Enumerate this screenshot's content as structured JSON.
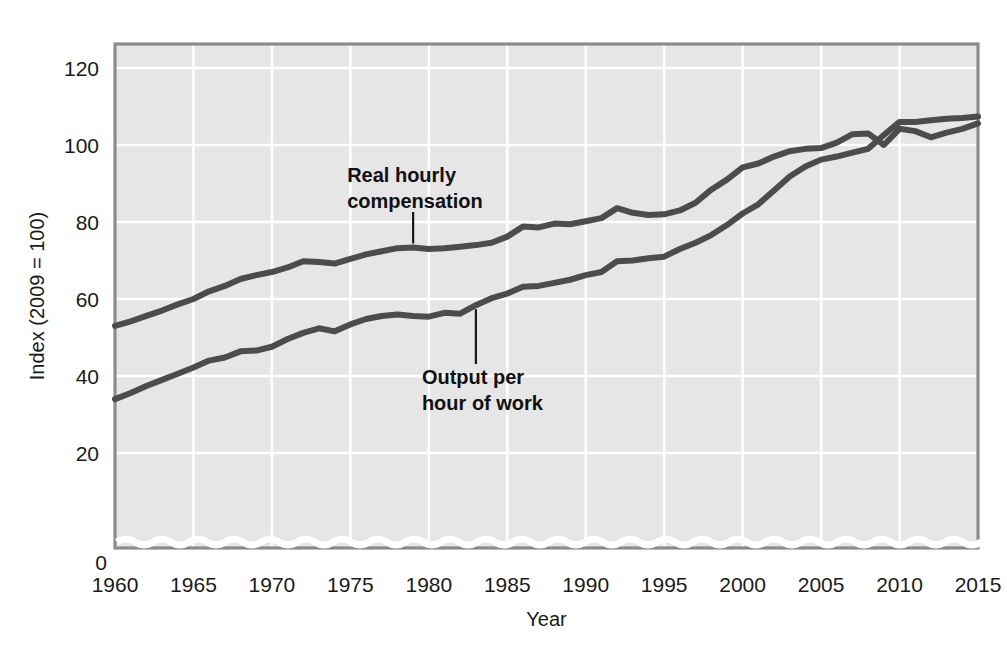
{
  "chart_data": {
    "type": "line",
    "title": "",
    "xlabel": "Year",
    "ylabel": "Index (2009 = 100)",
    "xlim": [
      1960,
      2015
    ],
    "ylim": [
      0,
      128
    ],
    "grid": true,
    "legend_position": "inline-annotations",
    "axis_break": true,
    "x_ticks": [
      "1960",
      "1965",
      "1970",
      "1975",
      "1980",
      "1985",
      "1990",
      "1995",
      "2000",
      "2005",
      "2010",
      "2015"
    ],
    "y_ticks": [
      "0",
      "20",
      "40",
      "60",
      "80",
      "100",
      "120"
    ],
    "zero_label": "0",
    "x": [
      1960,
      1961,
      1962,
      1963,
      1964,
      1965,
      1966,
      1967,
      1968,
      1969,
      1970,
      1971,
      1972,
      1973,
      1974,
      1975,
      1976,
      1977,
      1978,
      1979,
      1980,
      1981,
      1982,
      1983,
      1984,
      1985,
      1986,
      1987,
      1988,
      1989,
      1990,
      1991,
      1992,
      1993,
      1994,
      1995,
      1996,
      1997,
      1998,
      1999,
      2000,
      2001,
      2002,
      2003,
      2004,
      2005,
      2006,
      2007,
      2008,
      2009,
      2010,
      2011,
      2012,
      2013,
      2014,
      2015
    ],
    "series": [
      {
        "name": "Real hourly compensation",
        "color": "#4c4c4c",
        "values": [
          53.0,
          54.2,
          55.6,
          57.0,
          58.6,
          60.0,
          62.0,
          63.4,
          65.2,
          66.2,
          67.0,
          68.2,
          69.8,
          69.6,
          69.2,
          70.4,
          71.6,
          72.4,
          73.2,
          73.4,
          73.0,
          73.2,
          73.6,
          74.0,
          74.6,
          76.2,
          78.8,
          78.6,
          79.6,
          79.4,
          80.2,
          81.0,
          83.6,
          82.4,
          81.8,
          82.0,
          83.0,
          85.0,
          88.4,
          91.0,
          94.2,
          95.2,
          97.0,
          98.4,
          99.0,
          99.2,
          100.6,
          102.8,
          103.0,
          100.0,
          104.2,
          103.6,
          102.0,
          103.2,
          104.2,
          105.6
        ],
        "annotation": {
          "label_line1": "Real hourly",
          "label_line2": "compensation",
          "point_year": 1979,
          "point_value": 73.4
        }
      },
      {
        "name": "Output per hour of work",
        "color": "#4c4c4c",
        "values": [
          34.0,
          35.6,
          37.4,
          39.0,
          40.6,
          42.2,
          44.0,
          44.8,
          46.4,
          46.6,
          47.6,
          49.6,
          51.2,
          52.4,
          51.6,
          53.4,
          54.8,
          55.6,
          56.0,
          55.6,
          55.4,
          56.4,
          56.2,
          58.4,
          60.2,
          61.4,
          63.2,
          63.4,
          64.2,
          65.0,
          66.2,
          67.0,
          69.8,
          70.0,
          70.6,
          71.0,
          73.0,
          74.6,
          76.6,
          79.2,
          82.2,
          84.6,
          88.2,
          91.8,
          94.4,
          96.2,
          97.0,
          98.0,
          99.0,
          102.6,
          106.0,
          106.0,
          106.4,
          106.8,
          107.0,
          107.4
        ],
        "annotation": {
          "label_line1": "Output per",
          "label_line2": "hour of work",
          "point_year": 1983,
          "point_value": 58.4
        }
      }
    ]
  },
  "style": {
    "plot_bg": "#e6e6e6",
    "grid_color": "#ffffff",
    "frame_color": "#8c8c8c",
    "line_color": "#4c4c4c",
    "text_color": "#1a1a1a",
    "page_bg": "#ffffff"
  }
}
